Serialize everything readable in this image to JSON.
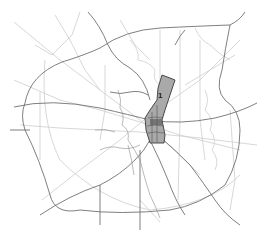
{
  "map": {
    "style": "monochrome road network",
    "colors": {
      "background": "#ffffff",
      "highway": "#6e6e6e",
      "minor_road": "#c8c8c8",
      "river": "#d6d6d6",
      "district_fill": "#a9a9a9",
      "district_stroke": "#3a3a3a",
      "district_core": "#555555"
    },
    "highlighted_area": {
      "label": "1"
    }
  }
}
